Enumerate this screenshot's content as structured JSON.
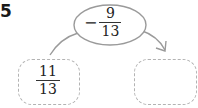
{
  "problem_number": "5",
  "operator": {
    "sign": "−",
    "numerator": "9",
    "denominator": "13"
  },
  "left_box": {
    "numerator": "11",
    "denominator": "13"
  },
  "right_box": {
    "value": ""
  },
  "colors": {
    "ellipse_stroke": "#9a9a9a",
    "dashed_box": "#b3b3b3",
    "text": "#222222"
  }
}
